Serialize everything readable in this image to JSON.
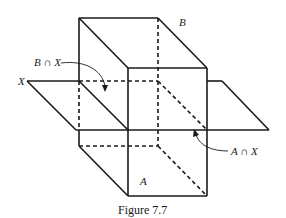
{
  "figure": {
    "caption": "Figure 7.7",
    "labels": {
      "box_top": "B",
      "box_bottom": "A",
      "plane": "X",
      "upper_intersection": "B ∩ X",
      "lower_intersection": "A ∩ X"
    },
    "line_color": "#1a1a1a",
    "background": "#ffffff"
  }
}
